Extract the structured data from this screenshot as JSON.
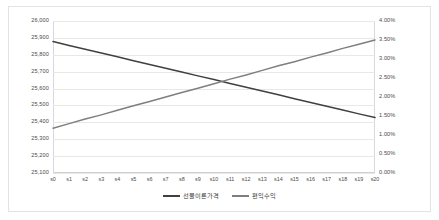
{
  "chart_data": {
    "type": "line",
    "title": "",
    "xlabel": "",
    "ylabel": "",
    "grid": true,
    "legend_position": "bottom",
    "categories": [
      "s0",
      "s1",
      "s2",
      "s3",
      "s4",
      "s5",
      "s6",
      "s7",
      "s8",
      "s9",
      "s10",
      "s11",
      "s12",
      "s13",
      "s14",
      "s15",
      "s16",
      "s17",
      "s18",
      "s19",
      "s20"
    ],
    "axes": {
      "left": {
        "label": "",
        "min": 25100,
        "max": 26000,
        "step": 100,
        "ticks": [
          "25,100",
          "25,200",
          "25,300",
          "25,400",
          "25,500",
          "25,600",
          "25,700",
          "25,800",
          "25,900",
          "26,000"
        ],
        "tick_values": [
          25100,
          25200,
          25300,
          25400,
          25500,
          25600,
          25700,
          25800,
          25900,
          26000
        ]
      },
      "right": {
        "label": "",
        "min": 0,
        "max": 4,
        "step": 0.5,
        "ticks": [
          "0.00%",
          "0.50%",
          "1.00%",
          "1.50%",
          "2.00%",
          "2.50%",
          "3.00%",
          "3.50%",
          "4.00%"
        ],
        "tick_values": [
          0,
          0.5,
          1,
          1.5,
          2,
          2.5,
          3,
          3.5,
          4
        ]
      }
    },
    "series": [
      {
        "name": "선물이론가격",
        "axis": "left",
        "color": "#404040",
        "values": [
          25878,
          25855,
          25833,
          25810,
          25788,
          25765,
          25743,
          25720,
          25698,
          25675,
          25653,
          25630,
          25608,
          25585,
          25563,
          25540,
          25518,
          25495,
          25473,
          25450,
          25428
        ]
      },
      {
        "name": "편익수익",
        "axis": "right",
        "color": "#7f7f7f",
        "values": [
          1.18,
          1.3,
          1.42,
          1.53,
          1.65,
          1.77,
          1.88,
          2.0,
          2.12,
          2.23,
          2.35,
          2.47,
          2.58,
          2.7,
          2.82,
          2.93,
          3.05,
          3.16,
          3.28,
          3.39,
          3.5
        ]
      }
    ]
  },
  "legend": {
    "items": [
      {
        "label": "선물이론가격",
        "color": "#404040"
      },
      {
        "label": "편익수익",
        "color": "#7f7f7f"
      }
    ]
  }
}
